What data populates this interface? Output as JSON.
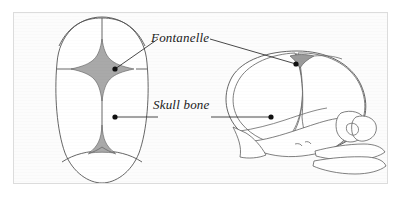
{
  "figure": {
    "type": "anatomical-diagram",
    "background_color": "#fcfcfc",
    "border_color": "#dcdcdc",
    "ink_color": "#3a3a3a",
    "fontanelle_fill": "#a9a9a9",
    "bone_fill": "#ffffff"
  },
  "labels": {
    "fontanelle": "Fontanelle",
    "skull_bone": "Skull bone"
  },
  "views": {
    "superior": {
      "name": "Superior (top) view of infant skull",
      "structures": [
        "frontal bones",
        "parietal bones",
        "occipital bone",
        "coronal suture",
        "sagittal suture",
        "lambdoid suture",
        "metopic suture",
        "anterior fontanelle",
        "posterior fontanelle"
      ]
    },
    "lateral": {
      "name": "Lateral (side) view of infant skull",
      "structures": [
        "frontal bone",
        "parietal bone",
        "occipital bone",
        "temporal bone",
        "sphenoid bone",
        "maxilla",
        "mandible",
        "coronal suture",
        "anterior fontanelle",
        "mastoid fontanelle"
      ]
    }
  },
  "markers": {
    "fontanelle_superior": {
      "x": 101,
      "y": 56
    },
    "fontanelle_lateral": {
      "x": 293,
      "y": 51
    },
    "skull_bone_superior": {
      "x": 101,
      "y": 104
    },
    "skull_bone_lateral": {
      "x": 268,
      "y": 104
    }
  }
}
